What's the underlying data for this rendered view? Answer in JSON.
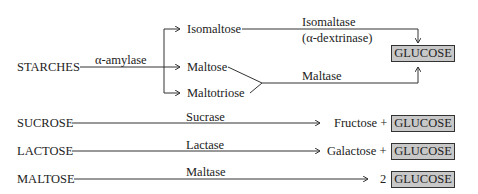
{
  "starches": {
    "source": "STARCHES",
    "enzyme": "α-amylase",
    "products": [
      "Isomaltose",
      "Maltose",
      "Maltotriose"
    ],
    "isomaltose_enzyme": [
      "Isomaltase",
      "(α-dextrinase)"
    ],
    "maltose_enzyme": "Maltase",
    "result": "GLUCOSE"
  },
  "reactions": [
    {
      "substrate": "SUCROSE",
      "enzyme": "Sucrase",
      "product_prefix": "Fructose +",
      "result": "GLUCOSE"
    },
    {
      "substrate": "LACTOSE",
      "enzyme": "Lactase",
      "product_prefix": "Galactose +",
      "result": "GLUCOSE"
    },
    {
      "substrate": "MALTOSE",
      "enzyme": "Maltase",
      "product_prefix": "2",
      "result": "GLUCOSE"
    }
  ],
  "colors": {
    "glucose_box": "#c8c8c8",
    "line": "#333333"
  }
}
